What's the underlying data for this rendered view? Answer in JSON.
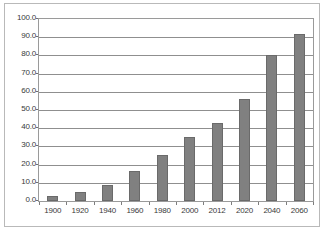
{
  "chart_data": {
    "type": "bar",
    "title": "",
    "subtitle": "",
    "xlabel": "",
    "ylabel": "",
    "categories": [
      "1900",
      "1920",
      "1940",
      "1960",
      "1980",
      "2000",
      "2012",
      "2020",
      "2040",
      "2060"
    ],
    "values": [
      3.0,
      5.0,
      9.0,
      16.5,
      25.5,
      35.0,
      43.0,
      56.0,
      80.0,
      92.0
    ],
    "ylim": [
      0,
      100
    ],
    "ytick_labels": [
      "100.0",
      "90.0",
      "80.0",
      "70.0",
      "60.0",
      "50.0",
      "40.0",
      "30.0",
      "20.0",
      "10.0",
      "0.0"
    ],
    "ytick_values": [
      100,
      90,
      80,
      70,
      60,
      50,
      40,
      30,
      20,
      10,
      0
    ],
    "grid": true,
    "legend": false,
    "legend_position": "none",
    "bar_color": "#808080",
    "bar_edge_color": "#6a6a6a",
    "gridline_color": "#8f8f8f",
    "axis_color": "#9a9a9a",
    "frame_color": "#b9b9b9",
    "background_color": "#ffffff",
    "text_color": "#3a3a3a"
  }
}
